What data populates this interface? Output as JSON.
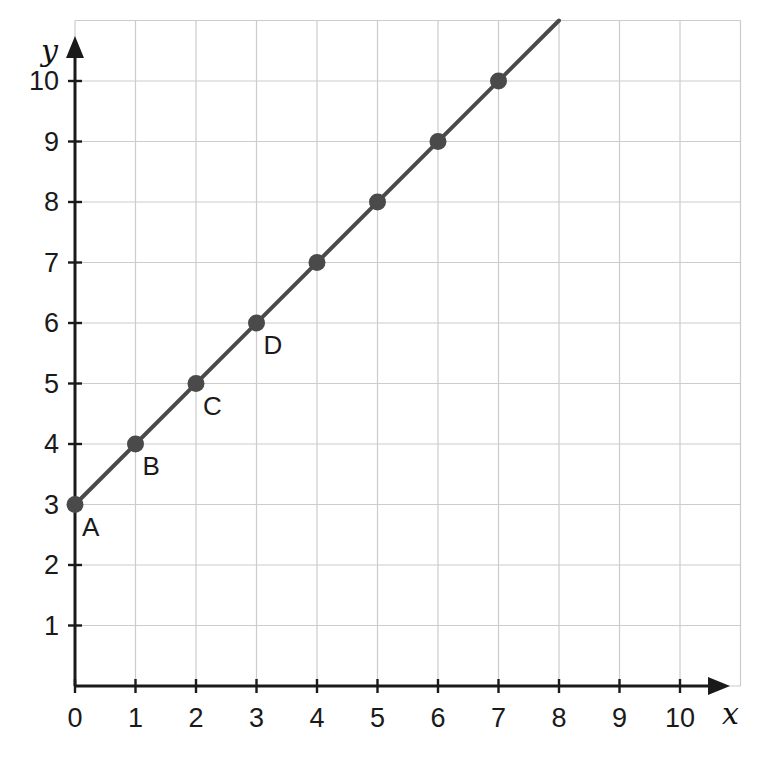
{
  "chart_data": {
    "type": "line",
    "title": "",
    "subtitle": "",
    "xlabel": "x",
    "ylabel": "y",
    "xlim": [
      0,
      11
    ],
    "ylim": [
      0,
      11
    ],
    "grid": true,
    "legend": "none",
    "x_ticks": [
      "0",
      "1",
      "2",
      "3",
      "4",
      "5",
      "6",
      "7",
      "8",
      "9",
      "10"
    ],
    "y_ticks": [
      "1",
      "2",
      "3",
      "4",
      "5",
      "6",
      "7",
      "8",
      "9",
      "10"
    ],
    "x_tick_values": [
      0,
      1,
      2,
      3,
      4,
      5,
      6,
      7,
      8,
      9,
      10
    ],
    "y_tick_values": [
      1,
      2,
      3,
      4,
      5,
      6,
      7,
      8,
      9,
      10
    ],
    "series": [
      {
        "name": "line",
        "equation": "y = x + 3",
        "line_from": [
          0,
          3
        ],
        "line_to": [
          8,
          11
        ],
        "x": [
          0,
          1,
          2,
          3,
          4,
          5,
          6,
          7
        ],
        "y": [
          3,
          4,
          5,
          6,
          7,
          8,
          9,
          10
        ]
      }
    ],
    "points": [
      {
        "label": "A",
        "x": 0,
        "y": 3
      },
      {
        "label": "B",
        "x": 1,
        "y": 4
      },
      {
        "label": "C",
        "x": 2,
        "y": 5
      },
      {
        "label": "D",
        "x": 3,
        "y": 6
      },
      {
        "label": "",
        "x": 4,
        "y": 7
      },
      {
        "label": "",
        "x": 5,
        "y": 8
      },
      {
        "label": "",
        "x": 6,
        "y": 9
      },
      {
        "label": "",
        "x": 7,
        "y": 10
      }
    ],
    "colors": {
      "line": "#4a4a4a",
      "marker": "#4a4a4a",
      "axis": "#1a1a1a",
      "grid": "#cccccc",
      "text": "#1a1a1a",
      "background": "#ffffff"
    }
  },
  "axes": {
    "x_axis_name": "x",
    "y_axis_name": "y",
    "origin_label": "0"
  }
}
